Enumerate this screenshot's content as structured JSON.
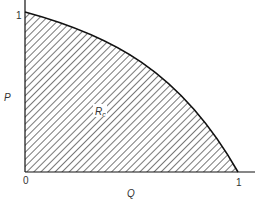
{
  "diagram": {
    "type": "shaded-region",
    "axes": {
      "x_label": "Q",
      "y_label": "P",
      "x_ticks": [
        "0",
        "1"
      ],
      "y_ticks": [
        "1"
      ]
    },
    "region_label": "R",
    "region_label_subscript": "c",
    "curve": "concave boundary from (0,1) to (1,0)",
    "colors": {
      "line": "#111111",
      "hatch": "#555555",
      "background": "#ffffff"
    }
  }
}
